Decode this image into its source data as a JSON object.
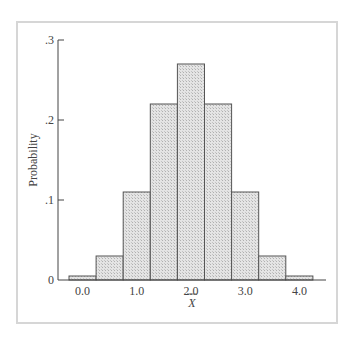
{
  "chart_data": {
    "type": "bar",
    "title": "",
    "xlabel": "X̄",
    "ylabel": "Probability",
    "categories": [
      "0.0",
      "0.5",
      "1.0",
      "1.5",
      "2.0",
      "2.5",
      "3.0",
      "3.5",
      "4.0"
    ],
    "values": [
      0.005,
      0.03,
      0.11,
      0.22,
      0.27,
      0.22,
      0.11,
      0.03,
      0.005
    ],
    "x_tick_labels": [
      "0.0",
      "1.0",
      "2.0",
      "3.0",
      "4.0"
    ],
    "y_tick_labels": [
      "0",
      ".1",
      ".2",
      ".3"
    ],
    "y_ticks": [
      0,
      0.1,
      0.2,
      0.3
    ],
    "ylim": [
      0,
      0.3
    ],
    "grid": false,
    "legend": null,
    "bar_fill": "#d9d9d9",
    "bar_edge": "#555555"
  }
}
